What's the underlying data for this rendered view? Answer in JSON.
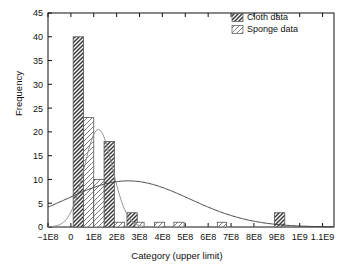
{
  "chart_data": {
    "type": "bar",
    "title": "",
    "subtitle": "",
    "xlabel": "Category (upper limit)",
    "ylabel": "Frequency",
    "xlim": [
      -100000000,
      1150000000
    ],
    "ylim": [
      0,
      45
    ],
    "ytick_step": 5,
    "grid": false,
    "legend_position": "top-right",
    "xticks": [
      {
        "value": -100000000,
        "label": "−1E8"
      },
      {
        "value": 0,
        "label": "0"
      },
      {
        "value": 100000000,
        "label": "1E8"
      },
      {
        "value": 200000000,
        "label": "2E8"
      },
      {
        "value": 300000000,
        "label": "3E8"
      },
      {
        "value": 400000000,
        "label": "4E8"
      },
      {
        "value": 500000000,
        "label": "5E8"
      },
      {
        "value": 600000000,
        "label": "6E8"
      },
      {
        "value": 700000000,
        "label": "7E8"
      },
      {
        "value": 800000000,
        "label": "8E8"
      },
      {
        "value": 900000000,
        "label": "9E8"
      },
      {
        "value": 1000000000,
        "label": "1E9"
      },
      {
        "value": 1100000000,
        "label": "1.1E9"
      }
    ],
    "yticks": [
      {
        "value": 0,
        "label": "0"
      },
      {
        "value": 5,
        "label": "5"
      },
      {
        "value": 10,
        "label": "10"
      },
      {
        "value": 15,
        "label": "15"
      },
      {
        "value": 20,
        "label": "20"
      },
      {
        "value": 25,
        "label": "25"
      },
      {
        "value": 30,
        "label": "30"
      },
      {
        "value": 35,
        "label": "35"
      },
      {
        "value": 40,
        "label": "40"
      },
      {
        "value": 45,
        "label": "45"
      }
    ],
    "series": [
      {
        "name": "Cloth data",
        "pattern": "dense-crosshatch",
        "bars": [
          {
            "x0": 10000000,
            "x1": 55000000,
            "value": 40
          },
          {
            "x0": 145000000,
            "x1": 190000000,
            "value": 18
          },
          {
            "x0": 245000000,
            "x1": 290000000,
            "value": 3
          },
          {
            "x0": 890000000,
            "x1": 935000000,
            "value": 3
          }
        ]
      },
      {
        "name": "Sponge data",
        "pattern": "light-diagonal",
        "bars": [
          {
            "x0": 55000000,
            "x1": 100000000,
            "value": 23
          },
          {
            "x0": 100000000,
            "x1": 145000000,
            "value": 10
          },
          {
            "x0": 190000000,
            "x1": 235000000,
            "value": 1
          },
          {
            "x0": 280000000,
            "x1": 320000000,
            "value": 1
          },
          {
            "x0": 365000000,
            "x1": 410000000,
            "value": 1
          },
          {
            "x0": 450000000,
            "x1": 495000000,
            "value": 1
          },
          {
            "x0": 640000000,
            "x1": 680000000,
            "value": 1
          }
        ]
      }
    ],
    "curves": [
      {
        "name": "sponge-fit",
        "type": "normal",
        "peak_value": 20.5,
        "mean": 120000000,
        "sigma": 62000000
      },
      {
        "name": "cloth-fit",
        "type": "normal",
        "peak_value": 9.7,
        "mean": 250000000,
        "sigma": 270000000
      }
    ]
  },
  "legend": {
    "items": [
      {
        "label": "Cloth data"
      },
      {
        "label": "Sponge data"
      }
    ]
  }
}
